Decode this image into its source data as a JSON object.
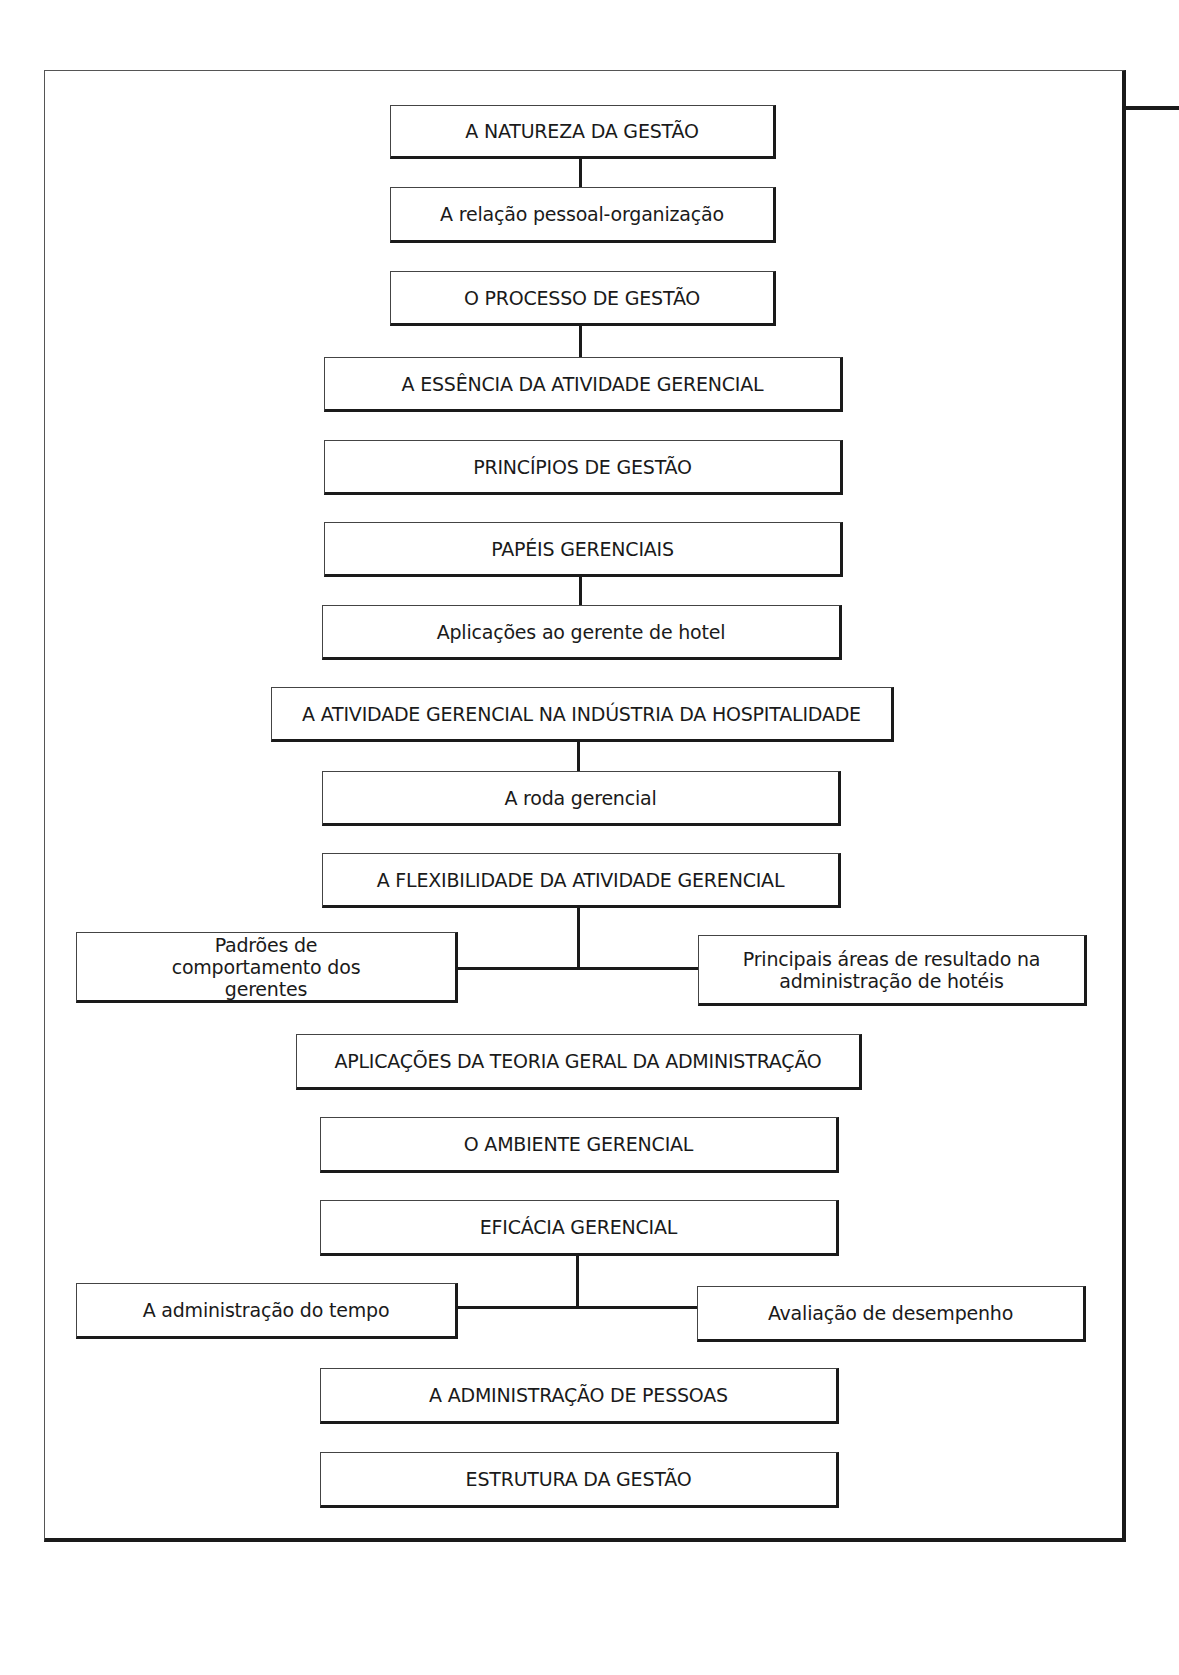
{
  "diagram": {
    "boxes": [
      {
        "id": "natureza",
        "label": "A NATUREZA DA GESTÃO"
      },
      {
        "id": "relacao",
        "label": "A relação pessoal-organização"
      },
      {
        "id": "processo",
        "label": "O PROCESSO DE GESTÃO"
      },
      {
        "id": "essencia",
        "label": "A ESSÊNCIA DA ATIVIDADE GERENCIAL"
      },
      {
        "id": "principios",
        "label": "PRINCÍPIOS DE GESTÃO"
      },
      {
        "id": "papeis",
        "label": "PAPÉIS GERENCIAIS"
      },
      {
        "id": "aplicacoes_hotel",
        "label": "Aplicações ao gerente de hotel"
      },
      {
        "id": "hospitalidade",
        "label": "A ATIVIDADE GERENCIAL NA INDÚSTRIA DA HOSPITALIDADE"
      },
      {
        "id": "roda",
        "label": "A roda gerencial"
      },
      {
        "id": "flexibilidade",
        "label": "A FLEXIBILIDADE DA ATIVIDADE GERENCIAL"
      },
      {
        "id": "padroes",
        "label": "Padrões de comportamento dos gerentes"
      },
      {
        "id": "areas",
        "label": "Principais áreas de resultado na administração de hotéis"
      },
      {
        "id": "teoria",
        "label": "APLICAÇÕES DA TEORIA GERAL DA ADMINISTRAÇÃO"
      },
      {
        "id": "ambiente",
        "label": "O AMBIENTE GERENCIAL"
      },
      {
        "id": "eficacia",
        "label": "EFICÁCIA GERENCIAL"
      },
      {
        "id": "tempo",
        "label": "A administração do tempo"
      },
      {
        "id": "avaliacao",
        "label": "Avaliação de desempenho"
      },
      {
        "id": "pessoas",
        "label": "A ADMINISTRAÇÃO DE PESSOAS"
      },
      {
        "id": "estrutura",
        "label": "ESTRUTURA DA GESTÃO"
      }
    ],
    "connections": [
      [
        "natureza",
        "relacao"
      ],
      [
        "processo",
        "essencia"
      ],
      [
        "papeis",
        "aplicacoes_hotel"
      ],
      [
        "hospitalidade",
        "roda"
      ],
      [
        "flexibilidade",
        "padroes"
      ],
      [
        "flexibilidade",
        "areas"
      ],
      [
        "eficacia",
        "tempo"
      ],
      [
        "eficacia",
        "avaliacao"
      ]
    ]
  }
}
